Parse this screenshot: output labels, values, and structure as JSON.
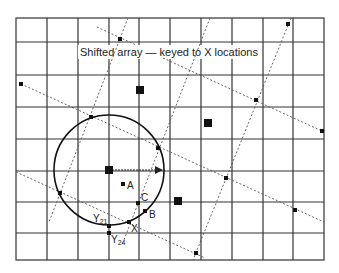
{
  "title": "Shifted array — keyed to X locations",
  "colors": {
    "grid": "#333333",
    "dotted": "#555555",
    "ink": "#111111",
    "background": "#ffffff"
  },
  "grid": {
    "x_lines": [
      16,
      47,
      78,
      109,
      139,
      170,
      201,
      232,
      263,
      293,
      324
    ],
    "y_lines": [
      18,
      42,
      75,
      107,
      139,
      171,
      202,
      233,
      260
    ]
  },
  "large_squares": [
    {
      "x": 109,
      "y": 170
    },
    {
      "x": 140,
      "y": 90
    },
    {
      "x": 208,
      "y": 123
    },
    {
      "x": 178,
      "y": 201
    }
  ],
  "small_points": [
    {
      "x": 120,
      "y": 39
    },
    {
      "x": 21,
      "y": 84
    },
    {
      "x": 288,
      "y": 24
    },
    {
      "x": 256,
      "y": 100
    },
    {
      "x": 322,
      "y": 131
    },
    {
      "x": 226,
      "y": 178
    },
    {
      "x": 295,
      "y": 210
    },
    {
      "x": 196,
      "y": 253
    },
    {
      "x": 91,
      "y": 117
    },
    {
      "x": 158,
      "y": 148
    },
    {
      "x": 60,
      "y": 193
    }
  ],
  "circle": {
    "cx": 109,
    "cy": 170,
    "r": 55
  },
  "labeled_points": [
    {
      "id": "A",
      "label": "A",
      "x": 123,
      "y": 184,
      "lx": 127,
      "ly": 186
    },
    {
      "id": "C",
      "label": "C",
      "x": 138,
      "y": 203,
      "lx": 141,
      "ly": 200
    },
    {
      "id": "B",
      "label": "B",
      "x": 145,
      "y": 211,
      "lx": 149,
      "ly": 218
    },
    {
      "id": "X",
      "label": "X",
      "x": 129,
      "y": 222,
      "lx": 131,
      "ly": 231
    },
    {
      "id": "Y21",
      "label": "Y",
      "sub": "21",
      "x": 109,
      "y": 226,
      "lx": 93,
      "ly": 220
    },
    {
      "id": "Y24",
      "label": "Y",
      "sub": "24",
      "x": 109,
      "y": 233,
      "lx": 112,
      "ly": 244
    }
  ]
}
